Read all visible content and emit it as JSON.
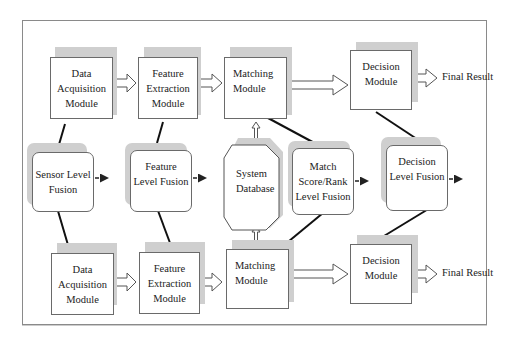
{
  "caption": "Multimodal biometric system architecture showing possible levels of fusion",
  "top_row": {
    "data_acquisition": "Data Acquisition Module",
    "feature_extraction": "Feature Extraction Module",
    "matching": "Matching Module",
    "decision": "Decision Module",
    "final_result": "Final Result"
  },
  "middle_row": {
    "sensor_fusion": "Sensor Level Fusion",
    "feature_fusion": "Feature Level Fusion",
    "system_database": "System Database",
    "match_fusion": "Match Score/Rank Level Fusion",
    "decision_fusion": "Decision Level Fusion"
  },
  "bottom_row": {
    "data_acquisition": "Data Acquisition Module",
    "feature_extraction": "Feature Extraction Module",
    "matching": "Matching Module",
    "decision": "Decision Module",
    "final_result": "Final Result"
  },
  "colors": {
    "border": "#6a6a6a",
    "shadow": "#cfcfcf",
    "frame": "#8a8a8a"
  }
}
